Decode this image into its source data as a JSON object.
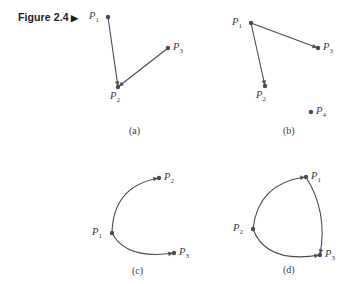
{
  "figure": {
    "label_text": "Figure 2.4",
    "label_arrow": "▶",
    "stroke_color": "#4a4a52",
    "dot_color": "#4a4a52",
    "background": "#ffffff"
  },
  "panels": [
    {
      "id": "a",
      "caption": "(a)",
      "caption_pos": {
        "x": 129,
        "y": 126
      },
      "points": [
        {
          "name": "P1",
          "base": "P",
          "sub": "1",
          "x": 108,
          "y": 17,
          "label_x": 89,
          "label_y": 11
        },
        {
          "name": "P2",
          "base": "P",
          "sub": "2",
          "x": 118,
          "y": 87,
          "label_x": 110,
          "label_y": 91
        },
        {
          "name": "P3",
          "base": "P",
          "sub": "3",
          "x": 168,
          "y": 48,
          "label_x": 173,
          "label_y": 42
        }
      ],
      "edges": [
        {
          "from": "P1",
          "to": "P2",
          "type": "line",
          "arrow": true
        },
        {
          "from": "P3",
          "to": "P2",
          "type": "line",
          "arrow": true
        }
      ]
    },
    {
      "id": "b",
      "caption": "(b)",
      "caption_pos": {
        "x": 283,
        "y": 126
      },
      "points": [
        {
          "name": "P1",
          "base": "P",
          "sub": "1",
          "x": 251,
          "y": 23,
          "label_x": 232,
          "label_y": 17
        },
        {
          "name": "P2",
          "base": "P",
          "sub": "2",
          "x": 265,
          "y": 86,
          "label_x": 256,
          "label_y": 90
        },
        {
          "name": "P3",
          "base": "P",
          "sub": "3",
          "x": 318,
          "y": 48,
          "label_x": 323,
          "label_y": 42
        },
        {
          "name": "P4",
          "base": "P",
          "sub": "4",
          "x": 311,
          "y": 112,
          "label_x": 316,
          "label_y": 106
        }
      ],
      "edges": [
        {
          "from": "P1",
          "to": "P2",
          "type": "line",
          "arrow": true
        },
        {
          "from": "P1",
          "to": "P3",
          "type": "line",
          "arrow": true
        }
      ]
    },
    {
      "id": "c",
      "caption": "(c)",
      "caption_pos": {
        "x": 132,
        "y": 266
      },
      "points": [
        {
          "name": "P1",
          "base": "P",
          "sub": "1",
          "x": 112,
          "y": 233,
          "label_x": 92,
          "label_y": 227
        },
        {
          "name": "P2",
          "base": "P",
          "sub": "2",
          "x": 159,
          "y": 178,
          "label_x": 164,
          "label_y": 172
        },
        {
          "name": "P3",
          "base": "P",
          "sub": "3",
          "x": 174,
          "y": 253,
          "label_x": 179,
          "label_y": 247
        }
      ],
      "edges": [
        {
          "from": "P1",
          "to": "P2",
          "type": "curve",
          "arrow": true
        },
        {
          "from": "P1",
          "to": "P3",
          "type": "curve",
          "arrow": true
        }
      ]
    },
    {
      "id": "d",
      "caption": "(d)",
      "caption_pos": {
        "x": 283,
        "y": 265
      },
      "points": [
        {
          "name": "P1",
          "base": "P",
          "sub": "1",
          "x": 306,
          "y": 177,
          "label_x": 311,
          "label_y": 171
        },
        {
          "name": "P2",
          "base": "P",
          "sub": "2",
          "x": 253,
          "y": 229,
          "label_x": 233,
          "label_y": 223
        },
        {
          "name": "P3",
          "base": "P",
          "sub": "3",
          "x": 320,
          "y": 255,
          "label_x": 325,
          "label_y": 249
        }
      ],
      "edges": [
        {
          "from": "P2",
          "to": "P1",
          "type": "curve",
          "arrow": true
        },
        {
          "from": "P1",
          "to": "P3",
          "type": "curve",
          "arrow": true
        },
        {
          "from": "P2",
          "to": "P3",
          "type": "curve",
          "arrow": true
        }
      ]
    }
  ],
  "geometry": {
    "dot_radius": 2.2,
    "stroke_width": 1.1,
    "arrow_size": 4.2,
    "curves": {
      "c_P1_P2": {
        "cx": 113,
        "cy": 186
      },
      "c_P1_P3": {
        "cx": 126,
        "cy": 260
      },
      "d_P2_P1": {
        "cx": 258,
        "cy": 183
      },
      "d_P1_P3": {
        "cx": 328,
        "cy": 212
      },
      "d_P2_P3": {
        "cx": 266,
        "cy": 264
      }
    }
  }
}
